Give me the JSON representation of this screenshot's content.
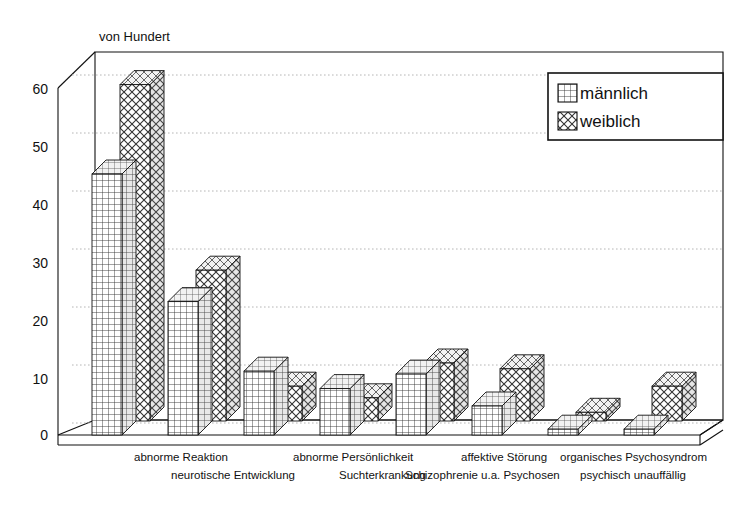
{
  "chart": {
    "axis_unit_label": "von Hundert",
    "y_ticks": [
      "0",
      "10",
      "20",
      "30",
      "40",
      "50",
      "60"
    ],
    "legend": {
      "items": [
        {
          "label": "männlich",
          "pattern": "grid-pattern",
          "swatch_name": "legend-swatch-maennlich"
        },
        {
          "label": "weiblich",
          "pattern": "diamond-hatch-pattern",
          "swatch_name": "legend-swatch-weiblich"
        }
      ]
    },
    "category_labels_row_top": [
      "abnorme Reaktion",
      "abnorme Persönlichkeit",
      "affektive Störung",
      "organisches Psychosyndrom"
    ],
    "category_labels_row_bottom": [
      "neurotische Entwicklung",
      "Suchterkrankung",
      "Schizophrenie u.a. Psychosen",
      "psychisch unauffällig"
    ]
  },
  "chart_data": {
    "type": "bar",
    "title": "",
    "subtitle": "",
    "xlabel": "",
    "ylabel": "von Hundert",
    "ylim": [
      0,
      63
    ],
    "yticks": [
      0,
      10,
      20,
      30,
      40,
      50,
      60
    ],
    "grid": true,
    "legend_position": "top-right",
    "three_d": true,
    "categories": [
      "abnorme Reaktion",
      "neurotische Entwicklung",
      "abnorme Persönlichkeit",
      "Suchterkrankung",
      "affektive Störung",
      "Schizophrenie u.a. Psychosen",
      "organisches Psychosyndrom",
      "psychisch unauffällig"
    ],
    "series": [
      {
        "name": "männlich",
        "values": [
          45,
          23,
          11,
          8,
          10.5,
          5,
          1,
          1
        ]
      },
      {
        "name": "weiblich",
        "values": [
          58,
          26,
          6,
          4,
          10,
          9,
          1.5,
          6
        ]
      }
    ]
  }
}
